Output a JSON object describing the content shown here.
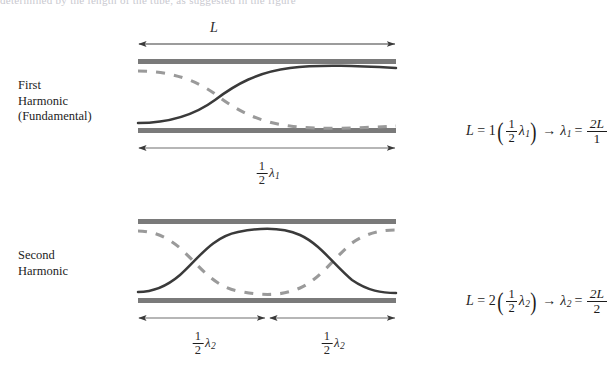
{
  "figure": {
    "bleed_text": "determined by the length of the tube, as suggested in the figure",
    "colors": {
      "tube_wall": "#7a7a7a",
      "solid_curve": "#3a3a3a",
      "dashed_curve": "#9a9a9a",
      "arrow": "#3a3a3a",
      "text": "#1c1c1c"
    }
  },
  "rows": [
    {
      "id": "first-harmonic",
      "label": "First\nHarmonic\n(Fundamental)",
      "top_dimension": {
        "label": "L",
        "style": "italic"
      },
      "bottom_dimensions": [
        {
          "numerator": "1",
          "denominator": "2",
          "symbol": "λ",
          "subscript": "1"
        }
      ],
      "equation": {
        "lhs_var": "L",
        "equals": "=",
        "multiplier": "1",
        "paren_open": "(",
        "frac_num": "1",
        "frac_den": "2",
        "lambda": "λ",
        "lambda_sub": "1",
        "paren_close": ")",
        "arrow": "→",
        "result_lambda": "λ",
        "result_sub": "1",
        "result_equals": "=",
        "result_num": "2L",
        "result_den": "1"
      }
    },
    {
      "id": "second-harmonic",
      "label": "Second\nHarmonic",
      "top_dimension": null,
      "bottom_dimensions": [
        {
          "numerator": "1",
          "denominator": "2",
          "symbol": "λ",
          "subscript": "2"
        },
        {
          "numerator": "1",
          "denominator": "2",
          "symbol": "λ",
          "subscript": "2"
        }
      ],
      "equation": {
        "lhs_var": "L",
        "equals": "=",
        "multiplier": "2",
        "paren_open": "(",
        "frac_num": "1",
        "frac_den": "2",
        "lambda": "λ",
        "lambda_sub": "2",
        "paren_close": ")",
        "arrow": "→",
        "result_lambda": "λ",
        "result_sub": "2",
        "result_equals": "=",
        "result_num": "2L",
        "result_den": "2"
      }
    }
  ],
  "geometry": {
    "tube_left": 138,
    "tube_right": 396,
    "row1_wall_top_y": 59,
    "row1_wall_bottom_y": 128,
    "row2_wall_top_y": 219,
    "row2_wall_bottom_y": 298,
    "wall_thickness": 5,
    "row1_arrow_top_y": 44,
    "row1_arrow_bottom_y": 148,
    "row2_arrow_bottom_y": 318
  }
}
